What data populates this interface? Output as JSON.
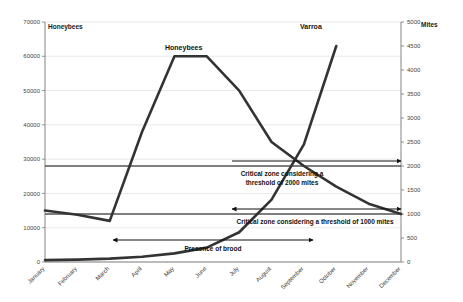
{
  "chart_data": {
    "type": "line",
    "title": "",
    "categories": [
      "January",
      "February",
      "March",
      "April",
      "May",
      "June",
      "July",
      "August",
      "September",
      "October",
      "November",
      "December"
    ],
    "grid": true,
    "legend_position": "inline-labels",
    "axes": {
      "left": {
        "label": "Honeybees",
        "min": 0,
        "max": 70000,
        "step": 10000,
        "ticks": [
          "0",
          "10000",
          "20000",
          "30000",
          "40000",
          "50000",
          "60000",
          "70000"
        ]
      },
      "right": {
        "label": "Mites",
        "min": 0,
        "max": 5000,
        "step": 500,
        "ticks": [
          "0",
          "500",
          "1000",
          "1500",
          "2000",
          "2500",
          "3000",
          "3500",
          "4000",
          "4500",
          "5000"
        ]
      },
      "bottom": {
        "label": ""
      }
    },
    "series": [
      {
        "name": "Honeybees",
        "axis": "left",
        "color": "#333333",
        "inline_label": "Honeybees",
        "values": [
          15000,
          13800,
          12000,
          38000,
          60000,
          60000,
          50000,
          35000,
          28000,
          22000,
          17000,
          14000
        ]
      },
      {
        "name": "Varroa",
        "axis": "right",
        "color": "#333333",
        "inline_label": "Varroa",
        "values": [
          40,
          50,
          70,
          110,
          180,
          300,
          620,
          1300,
          2450,
          4500,
          null,
          null
        ]
      }
    ],
    "threshold_lines": [
      {
        "name": "threshold-2000-mites",
        "axis": "right",
        "value": 2000,
        "color": "#555555"
      },
      {
        "name": "threshold-1000-mites",
        "axis": "right",
        "value": 1000,
        "color": "#555555"
      }
    ],
    "annotations": [
      {
        "name": "critical-zone-2000",
        "text": "Critical zone considering a",
        "text2": "threshold of 2000 mites"
      },
      {
        "name": "critical-zone-1000",
        "text": "Critical zone considering a threshold of 1000 mites"
      },
      {
        "name": "presence-of-brood",
        "text": "Presence of brood"
      }
    ]
  },
  "labels": {
    "left_axis_title": "Honeybees",
    "right_axis_title": "Mites",
    "honeybees_series": "Honeybees",
    "varroa_series": "Varroa",
    "critical_2000_line1": "Critical zone considering a",
    "critical_2000_line2": "threshold of 2000 mites",
    "critical_1000": "Critical zone considering a threshold of 1000 mites",
    "presence_of_brood": "Presence of brood"
  },
  "ticks": {
    "left": [
      "70000",
      "60000",
      "50000",
      "40000",
      "30000",
      "20000",
      "10000",
      "0"
    ],
    "right": [
      "5000",
      "4500",
      "4000",
      "3500",
      "3000",
      "2500",
      "2000",
      "1500",
      "1000",
      "500",
      "0"
    ],
    "months": [
      "January",
      "February",
      "March",
      "April",
      "May",
      "June",
      "July",
      "August",
      "September",
      "October",
      "November",
      "December"
    ]
  }
}
